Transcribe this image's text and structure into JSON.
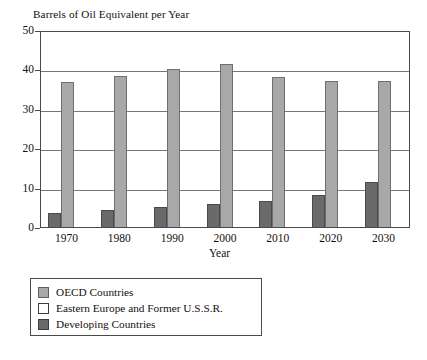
{
  "chart_data": {
    "type": "bar",
    "title": "Barrels of Oil Equivalent per Year",
    "xlabel": "Year",
    "ylabel": "",
    "categories": [
      "1970",
      "1980",
      "1990",
      "2000",
      "2010",
      "2020",
      "2030"
    ],
    "ylim": [
      0,
      50
    ],
    "yticks": [
      "0",
      "10",
      "20",
      "30",
      "40",
      "50"
    ],
    "grid": true,
    "legend_position": "below-left",
    "series": [
      {
        "name": "Developing Countries",
        "color": "#6a6a6a",
        "values": [
          3.5,
          4.2,
          5.0,
          5.8,
          6.5,
          8.2,
          11.5
        ]
      },
      {
        "name": "OECD Countries",
        "color": "#a8a8a8",
        "values": [
          36.7,
          38.3,
          40.0,
          41.5,
          38.2,
          37.0,
          37.0
        ]
      },
      {
        "name": "Eastern Europe and Former U.S.S.R.",
        "color": "#ffffff",
        "values": [
          0,
          0,
          0,
          0,
          0,
          0,
          0
        ]
      }
    ]
  },
  "legend": {
    "items": [
      {
        "label": "OECD Countries",
        "swatch": "oecd"
      },
      {
        "label": "Eastern Europe and Former U.S.S.R.",
        "swatch": "eeussr"
      },
      {
        "label": "Developing Countries",
        "swatch": "developing"
      }
    ]
  }
}
